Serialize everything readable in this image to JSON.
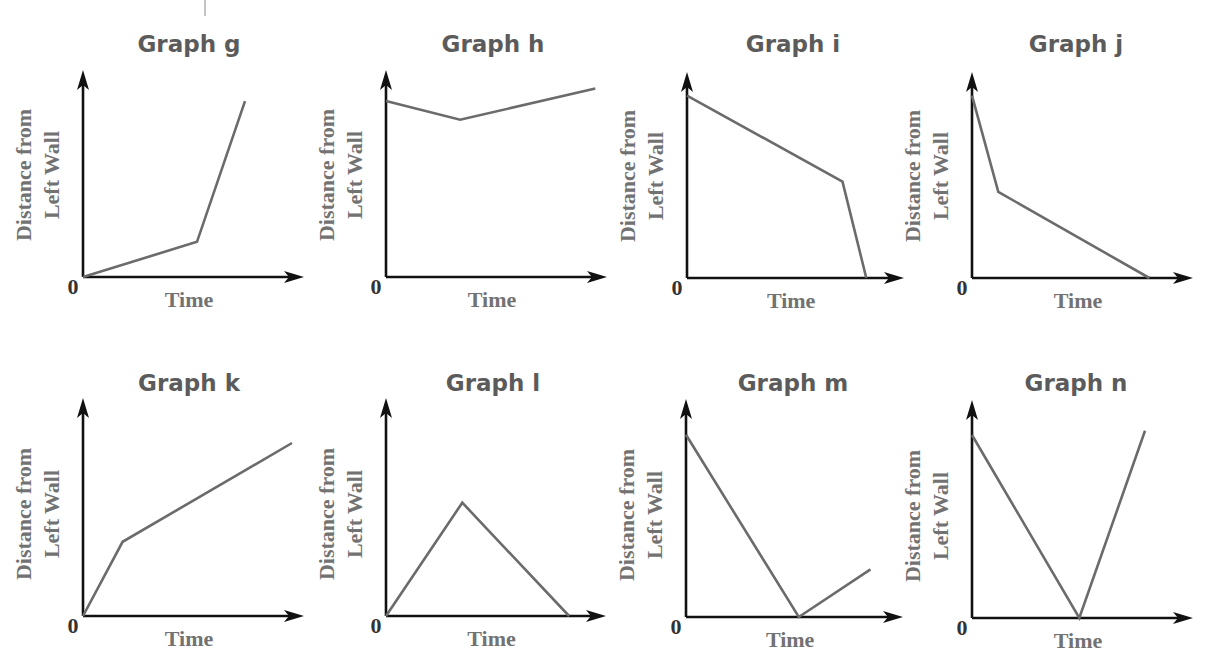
{
  "chart_data": [
    {
      "type": "line",
      "title": "Graph g",
      "xlabel": "Time",
      "ylabel": [
        "Distance from",
        "Left Wall"
      ],
      "origin_label": "0",
      "xlim": [
        0,
        10
      ],
      "ylim": [
        0,
        10
      ],
      "series": [
        {
          "name": "position",
          "x": [
            0,
            5.7,
            8.1
          ],
          "y": [
            0,
            1.7,
            8.5
          ]
        }
      ]
    },
    {
      "type": "line",
      "title": "Graph h",
      "xlabel": "Time",
      "ylabel": [
        "Distance from",
        "Left Wall"
      ],
      "origin_label": "0",
      "xlim": [
        0,
        10
      ],
      "ylim": [
        0,
        10
      ],
      "series": [
        {
          "name": "position",
          "x": [
            0,
            3.4,
            9.6
          ],
          "y": [
            8.5,
            7.6,
            9.1
          ]
        }
      ]
    },
    {
      "type": "line",
      "title": "Graph i",
      "xlabel": "Time",
      "ylabel": [
        "Distance from",
        "Left Wall"
      ],
      "origin_label": "0",
      "xlim": [
        0,
        10
      ],
      "ylim": [
        0,
        10
      ],
      "series": [
        {
          "name": "position",
          "x": [
            0,
            7.2,
            8.3
          ],
          "y": [
            8.9,
            4.7,
            0
          ]
        }
      ]
    },
    {
      "type": "line",
      "title": "Graph j",
      "xlabel": "Time",
      "ylabel": [
        "Distance from",
        "Left Wall"
      ],
      "origin_label": "0",
      "xlim": [
        0,
        10
      ],
      "ylim": [
        0,
        10
      ],
      "series": [
        {
          "name": "position",
          "x": [
            0,
            1.2,
            8.1
          ],
          "y": [
            8.9,
            4.2,
            0
          ]
        }
      ]
    },
    {
      "type": "line",
      "title": "Graph k",
      "xlabel": "Time",
      "ylabel": [
        "Distance from",
        "Left Wall"
      ],
      "origin_label": "0",
      "xlim": [
        0,
        10
      ],
      "ylim": [
        0,
        10
      ],
      "series": [
        {
          "name": "position",
          "x": [
            0,
            1.8,
            9.5
          ],
          "y": [
            0,
            3.6,
            8.4
          ]
        }
      ]
    },
    {
      "type": "line",
      "title": "Graph l",
      "xlabel": "Time",
      "ylabel": [
        "Distance from",
        "Left Wall"
      ],
      "origin_label": "0",
      "xlim": [
        0,
        10
      ],
      "ylim": [
        0,
        10
      ],
      "series": [
        {
          "name": "position",
          "x": [
            0,
            3.5,
            8.4
          ],
          "y": [
            0,
            5.5,
            0
          ]
        }
      ]
    },
    {
      "type": "line",
      "title": "Graph m",
      "xlabel": "Time",
      "ylabel": [
        "Distance from",
        "Left Wall"
      ],
      "origin_label": "0",
      "xlim": [
        0,
        10
      ],
      "ylim": [
        0,
        10
      ],
      "series": [
        {
          "name": "position",
          "x": [
            0,
            5.2,
            8.5
          ],
          "y": [
            8.8,
            0,
            2.3
          ]
        }
      ]
    },
    {
      "type": "line",
      "title": "Graph n",
      "xlabel": "Time",
      "ylabel": [
        "Distance from",
        "Left Wall"
      ],
      "origin_label": "0",
      "xlim": [
        0,
        10
      ],
      "ylim": [
        0,
        10
      ],
      "series": [
        {
          "name": "position",
          "x": [
            0,
            4.9,
            7.9
          ],
          "y": [
            8.8,
            0,
            9.0
          ]
        }
      ]
    }
  ]
}
